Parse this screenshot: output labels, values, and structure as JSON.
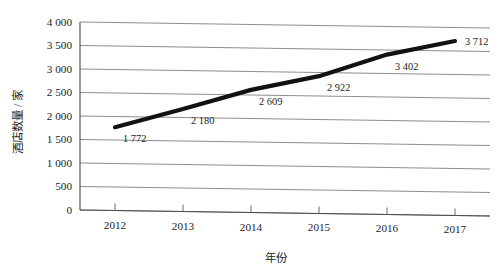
{
  "chart_data": {
    "type": "line",
    "title": "",
    "subtitle": "",
    "xlabel": "年份",
    "ylabel": "酒店数量 / 家",
    "categories": [
      "2012",
      "2013",
      "2014",
      "2015",
      "2016",
      "2017"
    ],
    "x": [
      2012,
      2013,
      2014,
      2015,
      2016,
      2017
    ],
    "values": [
      1772,
      2180,
      2609,
      2922,
      3402,
      3712
    ],
    "point_labels": [
      "1 772",
      "2 180",
      "2 609",
      "2 922",
      "3 402",
      "3 712"
    ],
    "series": [
      {
        "name": "酒店数量",
        "values": [
          1772,
          2180,
          2609,
          2922,
          3402,
          3712
        ],
        "color": "#121212"
      }
    ],
    "ylim": [
      0,
      4000
    ],
    "ytick_values": [
      0,
      500,
      1000,
      1500,
      2000,
      2500,
      3000,
      3500,
      4000
    ],
    "ytick_labels": [
      "0",
      "500",
      "1 000",
      "1 500",
      "2 000",
      "2 500",
      "3 000",
      "3 500",
      "4 000"
    ],
    "xtick_labels": [
      "2012",
      "2013",
      "2014",
      "2015",
      "2016",
      "2017"
    ],
    "grid": true,
    "grid_axis": "y",
    "legend": false,
    "legend_position": "none",
    "markers": false,
    "line_color": "#121212",
    "grid_color": "#8e8e8e",
    "axis_color": "#4a4a4a",
    "background_color": "#ffffff",
    "annotations": []
  },
  "axis": {
    "y_title": "酒店数量 / 家",
    "x_title": "年份"
  }
}
